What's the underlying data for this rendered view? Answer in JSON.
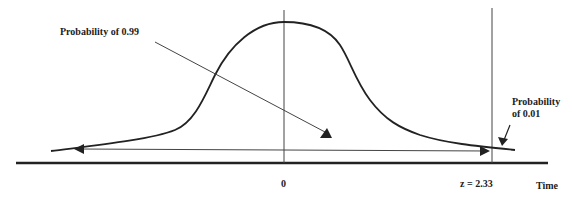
{
  "diagram": {
    "type": "normal-distribution-tail-probability",
    "annotations": {
      "left_region_label": "Probability of 0.99",
      "right_tail_label_line1": "Probability",
      "right_tail_label_line2": "of 0.01"
    },
    "axis": {
      "x_label": "Time",
      "center_tick_label": "0",
      "critical_value_label": "z  = 2.33"
    },
    "colors": {
      "line": "#222222",
      "background": "#ffffff"
    }
  }
}
